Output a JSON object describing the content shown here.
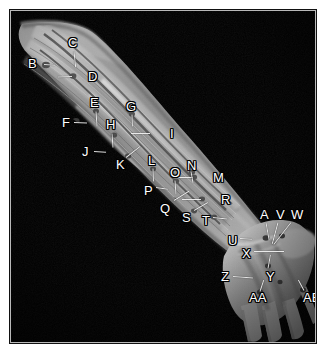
{
  "figure": {
    "kind": "anatomical-dissection-photograph",
    "background_color": "#000000",
    "page_background": "#ffffff",
    "specimen_description": "Dissected right upper limb, anterior view, showing forearm musculature, vessels and nerves extending to the hand",
    "tissue_tone": "#8d8d8d",
    "label_text_color": "#ffffff",
    "label_outline_color": "#000000",
    "leader_line_color": "#f2f2f2"
  },
  "labels": [
    {
      "id": "B",
      "text": "B",
      "x": 18,
      "y": 47,
      "lead": {
        "x": 34,
        "y": 54,
        "len": 11,
        "ang": 4
      }
    },
    {
      "id": "C",
      "text": "C",
      "x": 58,
      "y": 26,
      "lead": {
        "x": 64,
        "y": 41,
        "len": 16,
        "ang": 84
      }
    },
    {
      "id": "D",
      "text": "D",
      "x": 78,
      "y": 60,
      "lead": {
        "x": 62,
        "y": 66,
        "len": 14,
        "ang": 178
      }
    },
    {
      "id": "E",
      "text": "E",
      "x": 80,
      "y": 86,
      "lead": {
        "x": 86,
        "y": 101,
        "len": 15,
        "ang": 86
      }
    },
    {
      "id": "F",
      "text": "F",
      "x": 52,
      "y": 106,
      "lead": {
        "x": 64,
        "y": 112,
        "len": 13,
        "ang": 2
      }
    },
    {
      "id": "G",
      "text": "G",
      "x": 116,
      "y": 90,
      "lead": {
        "x": 122,
        "y": 104,
        "len": 12,
        "ang": 88
      }
    },
    {
      "id": "H",
      "text": "H",
      "x": 96,
      "y": 108,
      "lead": {
        "x": 102,
        "y": 123,
        "len": 14,
        "ang": 86
      }
    },
    {
      "id": "I",
      "text": "I",
      "x": 160,
      "y": 117,
      "lead": {
        "x": 140,
        "y": 123,
        "len": 19,
        "ang": 180
      }
    },
    {
      "id": "J",
      "text": "J",
      "x": 72,
      "y": 135,
      "lead": {
        "x": 84,
        "y": 141,
        "len": 12,
        "ang": 3
      }
    },
    {
      "id": "K",
      "text": "K",
      "x": 106,
      "y": 148,
      "lead": {
        "x": 116,
        "y": 147,
        "len": 18,
        "ang": -38
      }
    },
    {
      "id": "L",
      "text": "L",
      "x": 138,
      "y": 144,
      "lead": {
        "x": 143,
        "y": 158,
        "len": 13,
        "ang": 88
      }
    },
    {
      "id": "M",
      "text": "M",
      "x": 203,
      "y": 161,
      "lead": {
        "x": 183,
        "y": 167,
        "len": 19,
        "ang": 180
      }
    },
    {
      "id": "N",
      "text": "N",
      "x": 177,
      "y": 149,
      "lead": {
        "x": 181,
        "y": 161,
        "len": 12,
        "ang": 80
      }
    },
    {
      "id": "O",
      "text": "O",
      "x": 160,
      "y": 156,
      "lead": {
        "x": 165,
        "y": 170,
        "len": 14,
        "ang": 86
      }
    },
    {
      "id": "P",
      "text": "P",
      "x": 134,
      "y": 174,
      "lead": {
        "x": 146,
        "y": 177,
        "len": 12,
        "ang": 8
      }
    },
    {
      "id": "Q",
      "text": "Q",
      "x": 150,
      "y": 192,
      "lead": {
        "x": 164,
        "y": 190,
        "len": 18,
        "ang": -32
      }
    },
    {
      "id": "R",
      "text": "R",
      "x": 211,
      "y": 183,
      "lead": {
        "x": 191,
        "y": 189,
        "len": 19,
        "ang": 180
      }
    },
    {
      "id": "S",
      "text": "S",
      "x": 172,
      "y": 201,
      "lead": {
        "x": 184,
        "y": 200,
        "len": 16,
        "ang": -30
      }
    },
    {
      "id": "T",
      "text": "T",
      "x": 192,
      "y": 204,
      "lead": {
        "x": 203,
        "y": 207,
        "len": 14,
        "ang": 6
      }
    },
    {
      "id": "U",
      "text": "U",
      "x": 218,
      "y": 224,
      "lead": {
        "x": 230,
        "y": 228,
        "len": 12,
        "ang": 4
      }
    },
    {
      "id": "X",
      "text": "X",
      "x": 232,
      "y": 237,
      "lead": {
        "x": 244,
        "y": 241,
        "len": 30,
        "ang": 0
      }
    },
    {
      "id": "A",
      "text": "A",
      "x": 250,
      "y": 198,
      "lead": {
        "x": 256,
        "y": 212,
        "len": 18,
        "ang": 80
      }
    },
    {
      "id": "V",
      "text": "V",
      "x": 266,
      "y": 198,
      "lead": {
        "x": 268,
        "y": 212,
        "len": 22,
        "ang": 105
      }
    },
    {
      "id": "W",
      "text": "W",
      "x": 281,
      "y": 198,
      "lead": {
        "x": 281,
        "y": 212,
        "len": 28,
        "ang": 128
      }
    },
    {
      "id": "Y",
      "text": "Y",
      "x": 256,
      "y": 260,
      "lead": {
        "x": 258,
        "y": 258,
        "len": 14,
        "ang": -80
      }
    },
    {
      "id": "Z",
      "text": "Z",
      "x": 211,
      "y": 260,
      "lead": {
        "x": 223,
        "y": 266,
        "len": 20,
        "ang": 4
      }
    },
    {
      "id": "AA",
      "text": "AA",
      "x": 239,
      "y": 281,
      "lead": {
        "x": 250,
        "y": 281,
        "len": 12,
        "ang": -72
      }
    },
    {
      "id": "AB",
      "text": "AB",
      "x": 293,
      "y": 281,
      "lead": {
        "x": 294,
        "y": 280,
        "len": 12,
        "ang": -118
      }
    }
  ],
  "label_sequence": "B C D E F G H I J K L M N O P Q R S T U X A V W Y Z AA AB"
}
